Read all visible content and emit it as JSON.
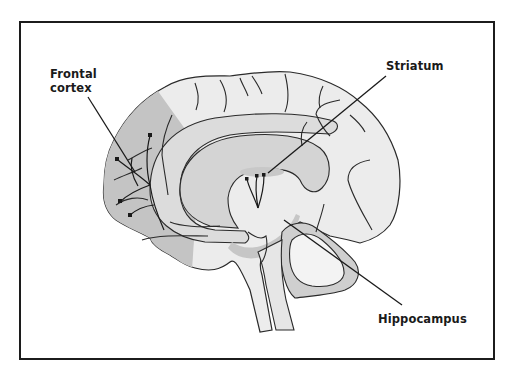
{
  "diagram": {
    "type": "brain-sagittal-section",
    "labels": {
      "frontal_cortex_line1": "Frontal",
      "frontal_cortex_line2": "cortex",
      "striatum": "Striatum",
      "hippocampus": "Hippocampus"
    },
    "colors": {
      "frame": "#1c1c1c",
      "brain_fill": "#ececec",
      "frontal_shade": "#c4c4c4",
      "corpus_callosum": "#d6d6d6",
      "hippocampus_shade": "#c8c8c8",
      "outline": "#2a2a2a"
    }
  }
}
